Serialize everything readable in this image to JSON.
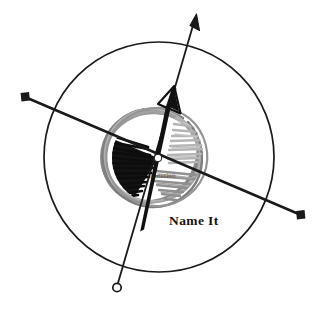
{
  "figure": {
    "title": "Name It",
    "caption_label": "Name It",
    "center_label": "Emotion",
    "background_color": "#ffffff"
  },
  "colors": {
    "stroke_black": "#1a1a1a",
    "scribble_gray": "#8c8c8c",
    "scribble_gray_light": "#b5b5b5",
    "hatch_black": "#111111",
    "hatch_gray_light": "#b0b0b0",
    "hatch_gray_mid": "#8a8a8a",
    "text_color": "#151515",
    "white": "#ffffff"
  },
  "outer_circle": {
    "name": "outer-boundary-circle",
    "cx": 159,
    "cy": 157,
    "r": 115,
    "stroke_width": 1.6,
    "fill": "none"
  },
  "scribble_ring": {
    "name": "scribbled-inner-ring",
    "cx": 158,
    "cy": 158,
    "r": 48,
    "passes": 7,
    "stroke_width": 2.6
  },
  "sectors": [
    {
      "name": "sector-hatch-black",
      "shade": "black",
      "position": "left",
      "fill": "#111111",
      "hatch_lines": 16
    },
    {
      "name": "sector-hatch-light-gray",
      "shade": "light-gray",
      "position": "upper-right",
      "fill": "#b0b0b0",
      "hatch_lines": 12
    },
    {
      "name": "sector-hatch-mid-gray",
      "shade": "mid-gray",
      "position": "lower-right",
      "fill": "#8a8a8a",
      "hatch_lines": 10
    }
  ],
  "axes": [
    {
      "name": "axis-square-ended-diagonal",
      "type": "double-square-endpoint-line",
      "x1": 25,
      "y1": 97,
      "x2": 301,
      "y2": 215,
      "stroke_width": 2.4,
      "endpoint_marker": "filled-square",
      "marker_size": 7
    },
    {
      "name": "axis-arrow-open-circle",
      "type": "arrow-to-circle-line",
      "x1": 196,
      "y1": 16,
      "x2": 118,
      "y2": 285,
      "stroke_width": 1.7,
      "start_marker": "arrowhead",
      "end_marker": "open-circle",
      "marker_size": 5
    }
  ],
  "vector_arrow": {
    "name": "thick-tapered-vector-arrow",
    "tail_x": 141,
    "tail_y": 230,
    "head_x": 172,
    "head_y": 95,
    "head_style": "outlined-triangle",
    "tail_width": 1.5,
    "body_width": 6.5
  },
  "center_point": {
    "name": "origin-center-dot",
    "cx": 158,
    "cy": 158,
    "r": 3.6,
    "fill": "#ffffff",
    "stroke": "#1a1a1a"
  }
}
